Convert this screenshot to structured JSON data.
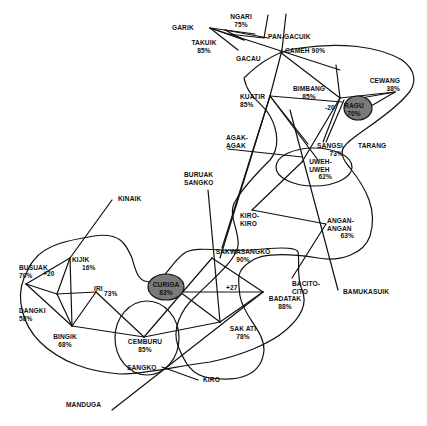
{
  "diagram": {
    "type": "network-sociogram",
    "highlight_color": "#7a7a7a",
    "line_color": "#111111",
    "nodes": {
      "garik": {
        "name": "GARIK",
        "pct": ""
      },
      "ngari": {
        "name": "NGARI",
        "pct": "75%"
      },
      "takuik": {
        "name": "TAKUIK",
        "pct": "85%"
      },
      "gacau": {
        "name": "GACAU",
        "pct": ""
      },
      "pangacuik": {
        "name": "PAN-GACUIK",
        "pct": ""
      },
      "cameh": {
        "name": "CAMEH 90%",
        "pct": ""
      },
      "kuatir": {
        "name": "KUATIR",
        "pct": "85%"
      },
      "bimbang": {
        "name": "BIMBANG",
        "pct": "85%"
      },
      "cewang": {
        "name": "CEWANG",
        "pct": "38%"
      },
      "ragu": {
        "name": "RAGU",
        "pct": "70%"
      },
      "tarang": {
        "name": "TARANG",
        "pct": ""
      },
      "agakagak": {
        "name": "AGAK-\nAGAK",
        "pct": ""
      },
      "sangsi": {
        "name": "SANGSI",
        "pct": "73%"
      },
      "uweh": {
        "name": "UWEH-\nUWEH",
        "pct": "62%"
      },
      "buruak": {
        "name": "BURUAK\nSANGKO",
        "pct": ""
      },
      "kirokiro": {
        "name": "KIRO-\nKIRO",
        "pct": ""
      },
      "angan": {
        "name": "ANGAN-\nANGAN",
        "pct": "63%"
      },
      "kinaik": {
        "name": "KINAIK",
        "pct": ""
      },
      "sakwasangko": {
        "name": "SAKWASANGKO",
        "pct": "90%"
      },
      "bacitocito": {
        "name": "BACITO-\nCITO",
        "pct": ""
      },
      "bamukasuik": {
        "name": "BAMUKASUIK",
        "pct": ""
      },
      "busuak": {
        "name": "BUSUAK",
        "pct": "70%"
      },
      "kijik": {
        "name": "KIJIK",
        "pct": "16%"
      },
      "iri": {
        "name": "IRI",
        "pct": "73%"
      },
      "dangki": {
        "name": "DANGKI",
        "pct": "58%"
      },
      "curiga": {
        "name": "CURIGA",
        "pct": "83%"
      },
      "badatak": {
        "name": "BADATAK",
        "pct": "88%"
      },
      "bingik": {
        "name": "BINGIK",
        "pct": "68%"
      },
      "cemburu": {
        "name": "CEMBURU",
        "pct": "85%"
      },
      "sakati": {
        "name": "SAK ATI",
        "pct": "78%"
      },
      "sangko": {
        "name": "SANGKO",
        "pct": ""
      },
      "kiro": {
        "name": "KIRO",
        "pct": ""
      },
      "manduga": {
        "name": "MANDUGA",
        "pct": ""
      }
    },
    "edge_labels": {
      "ragu_minus": "-20",
      "busuak_plus": "+20",
      "curiga_plus": "+27"
    }
  }
}
